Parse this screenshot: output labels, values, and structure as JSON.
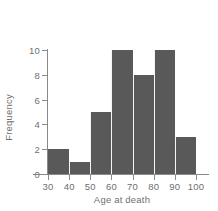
{
  "chart_data": {
    "type": "bar",
    "title": "",
    "subtitle": "",
    "xlabel": "Age at death",
    "ylabel": "Frequency",
    "bin_edges": [
      30,
      40,
      50,
      60,
      70,
      80,
      90,
      100
    ],
    "categories": [
      "30-40",
      "40-50",
      "50-60",
      "60-70",
      "70-80",
      "80-90",
      "90-100"
    ],
    "values": [
      2,
      1,
      5,
      10,
      8,
      10,
      3
    ],
    "xlim": [
      30,
      100
    ],
    "ylim": [
      0,
      10
    ],
    "x_ticks": [
      "30",
      "40",
      "50",
      "60",
      "70",
      "80",
      "90",
      "100"
    ],
    "y_ticks": [
      "0",
      "2",
      "4",
      "6",
      "8",
      "10"
    ],
    "grid": false,
    "legend": null,
    "bar_color": "#595959",
    "axis_color": "#8a8a8a",
    "text_color": "#6f6f6f",
    "background_color": "#ffffff",
    "annotations": []
  }
}
